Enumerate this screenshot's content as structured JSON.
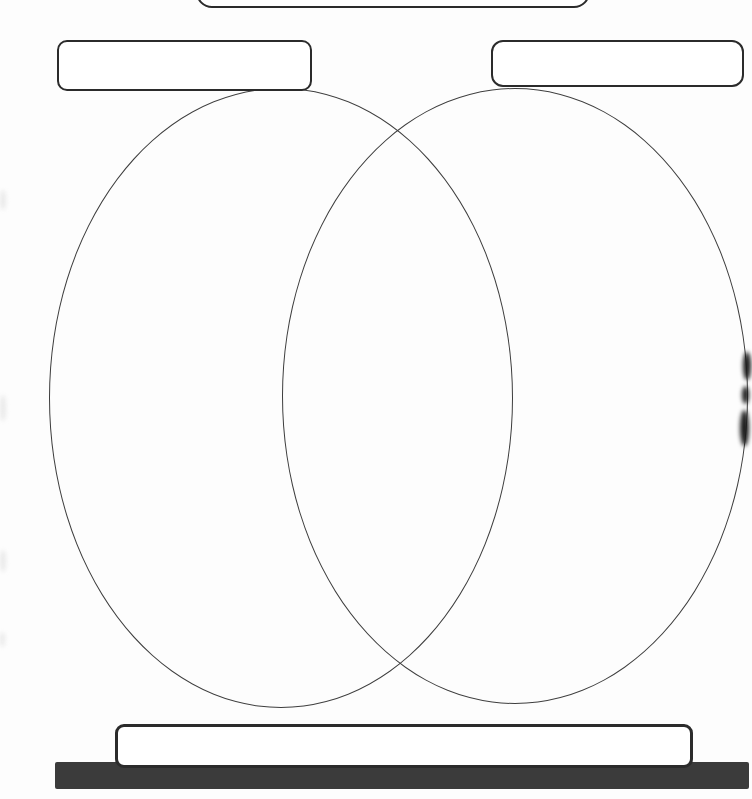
{
  "document": {
    "type": "venn-diagram-worksheet",
    "background_color": "#fdfdfd",
    "ink_color": "#2b2b2b",
    "ellipse_outline_color": "#3e3e3e"
  },
  "diagram": {
    "title_box": {
      "text": ""
    },
    "left_label_box": {
      "text": ""
    },
    "right_label_box": {
      "text": ""
    },
    "left_circle": {
      "text": ""
    },
    "right_circle": {
      "text": ""
    },
    "overlap_region": {
      "text": ""
    },
    "bottom_box": {
      "text": ""
    }
  },
  "footer": {
    "bar_color": "#3b3b3b"
  }
}
